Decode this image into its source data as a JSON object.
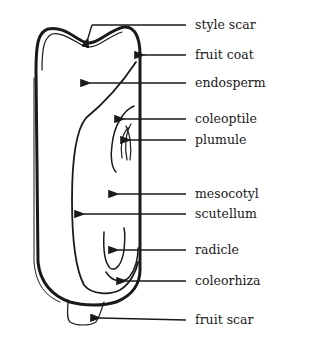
{
  "diagram": {
    "labels": [
      {
        "id": "style-scar",
        "text": "style scar",
        "y": 25
      },
      {
        "id": "fruit-coat",
        "text": "fruit coat",
        "y": 55
      },
      {
        "id": "endosperm",
        "text": "endosperm",
        "y": 83
      },
      {
        "id": "coleoptile",
        "text": "coleoptile",
        "y": 119
      },
      {
        "id": "plumule",
        "text": "plumule",
        "y": 140
      },
      {
        "id": "mesocotyl",
        "text": "mesocotyl",
        "y": 194
      },
      {
        "id": "scutellum",
        "text": "scutellum",
        "y": 214
      },
      {
        "id": "radicle",
        "text": "radicle",
        "y": 250
      },
      {
        "id": "coleorhiza",
        "text": "coleorhiza",
        "y": 281
      },
      {
        "id": "fruit-scar",
        "text": "fruit scar",
        "y": 320
      }
    ],
    "colors": {
      "ink": "#1a1a1a",
      "background": "#ffffff"
    }
  }
}
